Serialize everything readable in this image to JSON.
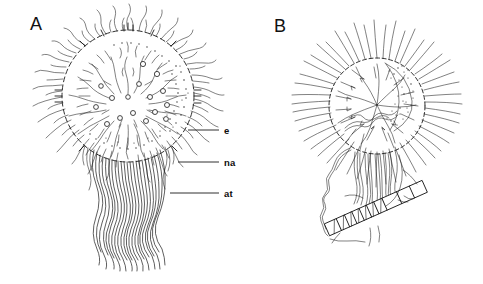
{
  "figure": {
    "kind": "line-drawing",
    "background_color": "#ffffff",
    "ink_color": "#1a1a1a",
    "width": 483,
    "height": 284,
    "panels": [
      {
        "id": "A",
        "letter": "A",
        "letter_x": 30,
        "letter_y": 30,
        "description": "spherical ciliated cell with radiating flagella and long trailing filaments"
      },
      {
        "id": "B",
        "letter": "B",
        "letter_x": 274,
        "letter_y": 32,
        "description": "spherical ciliated cell with stippled crescent and attached segmented rod"
      }
    ],
    "leader_labels": [
      {
        "id": "e",
        "text": "e",
        "text_x": 224,
        "text_y": 134,
        "line_x1": 188,
        "line_y1": 130,
        "line_x2": 219,
        "line_y2": 130
      },
      {
        "id": "na",
        "text": "na",
        "text_x": 224,
        "text_y": 166,
        "line_x1": 178,
        "line_y1": 162,
        "line_x2": 219,
        "line_y2": 162
      },
      {
        "id": "at",
        "text": "at",
        "text_x": 224,
        "text_y": 197,
        "line_x1": 170,
        "line_y1": 193,
        "line_x2": 219,
        "line_y2": 193
      }
    ],
    "geometry": {
      "panel_a_circle": {
        "cx": 128,
        "cy": 96,
        "r": 66
      },
      "panel_b_circle": {
        "cx": 377,
        "cy": 106,
        "r": 48
      },
      "panel_a_filament_top": 160,
      "panel_a_filament_bottom": 266,
      "panel_b_rod_angle_deg": -24
    }
  }
}
